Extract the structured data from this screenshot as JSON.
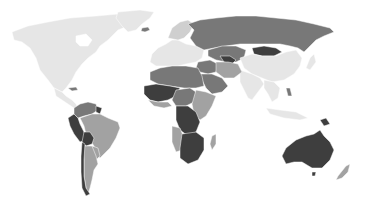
{
  "map": {
    "type": "choropleth",
    "style": "grayscale",
    "background": "#ffffff",
    "legend": null,
    "title": null,
    "shades": {
      "lightest": "#e6e6e6",
      "light": "#cfcfcf",
      "mid": "#a2a2a2",
      "dark": "#787878",
      "darkest": "#3e3e3e"
    },
    "regions": [
      {
        "name": "north-america",
        "shade": "lightest"
      },
      {
        "name": "greenland",
        "shade": "lightest"
      },
      {
        "name": "central-america",
        "shade": "lightest"
      },
      {
        "name": "caribbean",
        "shade": "dark"
      },
      {
        "name": "colombia-venezuela",
        "shade": "dark"
      },
      {
        "name": "guianas",
        "shade": "darkest"
      },
      {
        "name": "ecuador-peru",
        "shade": "darkest"
      },
      {
        "name": "brazil",
        "shade": "mid"
      },
      {
        "name": "bolivia",
        "shade": "darkest"
      },
      {
        "name": "paraguay-uruguay",
        "shade": "mid"
      },
      {
        "name": "argentina",
        "shade": "mid"
      },
      {
        "name": "chile",
        "shade": "darkest"
      },
      {
        "name": "europe",
        "shade": "lightest"
      },
      {
        "name": "scandinavia",
        "shade": "light"
      },
      {
        "name": "iceland",
        "shade": "dark"
      },
      {
        "name": "russia",
        "shade": "dark"
      },
      {
        "name": "kazakhstan-central-asia",
        "shade": "dark"
      },
      {
        "name": "uzbekistan-turkmenistan",
        "shade": "darkest"
      },
      {
        "name": "mongolia",
        "shade": "darkest"
      },
      {
        "name": "china",
        "shade": "lightest"
      },
      {
        "name": "india",
        "shade": "lightest"
      },
      {
        "name": "southeast-asia",
        "shade": "lightest"
      },
      {
        "name": "philippines",
        "shade": "dark"
      },
      {
        "name": "japan",
        "shade": "lightest"
      },
      {
        "name": "indonesia",
        "shade": "lightest"
      },
      {
        "name": "papua-new-guinea",
        "shade": "darkest"
      },
      {
        "name": "middle-east",
        "shade": "dark"
      },
      {
        "name": "arabia",
        "shade": "dark"
      },
      {
        "name": "iran-afghanistan",
        "shade": "mid"
      },
      {
        "name": "north-africa",
        "shade": "dark"
      },
      {
        "name": "west-africa-sahel",
        "shade": "darkest"
      },
      {
        "name": "west-africa-coast",
        "shade": "mid"
      },
      {
        "name": "central-africa",
        "shade": "dark"
      },
      {
        "name": "east-africa",
        "shade": "mid"
      },
      {
        "name": "congo",
        "shade": "darkest"
      },
      {
        "name": "angola-namibia",
        "shade": "mid"
      },
      {
        "name": "southern-africa",
        "shade": "darkest"
      },
      {
        "name": "madagascar",
        "shade": "mid"
      },
      {
        "name": "australia",
        "shade": "darkest"
      },
      {
        "name": "tasmania",
        "shade": "darkest"
      },
      {
        "name": "new-zealand",
        "shade": "mid"
      }
    ]
  }
}
